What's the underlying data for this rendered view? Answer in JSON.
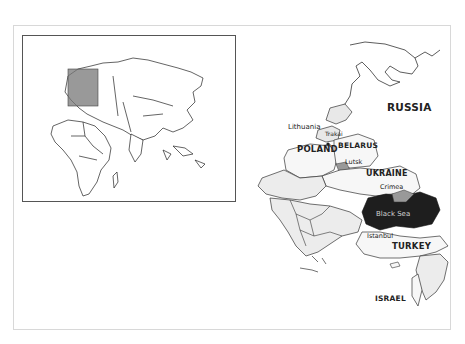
{
  "map": {
    "inset": {
      "description": "Locator map of Europe, Africa and Asia with highlighted region",
      "highlight_color": "#8a8a8a"
    },
    "main": {
      "labels": {
        "russia": "RUSSIA",
        "lithuania": "Lithuania",
        "trakai": "Trakai",
        "poland": "POLAND",
        "belarus": "BELARUS",
        "lutsk": "Lutsk",
        "ukraine": "UKRAINE",
        "crimea": "Crimea",
        "black_sea": "Black Sea",
        "istanbul": "Istanbul",
        "turkey": "TURKEY",
        "israel": "ISRAEL"
      },
      "colors": {
        "land": "#f0f0f0",
        "border": "#333333",
        "black_sea": "#1e1e1e",
        "highlight": "#9a9a9a"
      }
    },
    "caption": ""
  }
}
